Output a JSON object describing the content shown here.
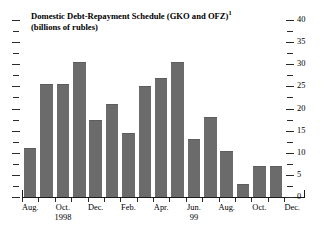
{
  "title": {
    "line1": "Domestic Debt-Repayment Schedule (GKO and OFZ)",
    "footnote_marker": "1",
    "line2": "(billions of rubles)"
  },
  "axes": {
    "y_label": "",
    "y_ticks": [
      "0",
      "5",
      "10",
      "15",
      "20",
      "25",
      "30",
      "35",
      "40"
    ],
    "x_labels": [
      {
        "label": "Aug.",
        "year": ""
      },
      {
        "label": "Oct.",
        "year": "1998"
      },
      {
        "label": "Dec.",
        "year": ""
      },
      {
        "label": "Feb.",
        "year": ""
      },
      {
        "label": "Apr.",
        "year": ""
      },
      {
        "label": "Jun.",
        "year": "99"
      },
      {
        "label": "Aug.",
        "year": ""
      },
      {
        "label": "Oct.",
        "year": ""
      },
      {
        "label": "Dec.",
        "year": ""
      }
    ]
  },
  "style": {
    "bar_color": "#6b6b6b",
    "axis_color": "#1a1a1a",
    "background": "#ffffff"
  },
  "chart_data": {
    "type": "bar",
    "title": "Domestic Debt-Repayment Schedule (GKO and OFZ)",
    "subtitle": "(billions of rubles)",
    "xlabel": "",
    "ylabel": "billions of rubles",
    "ylim": [
      0,
      40
    ],
    "y_ticks": [
      0,
      5,
      10,
      15,
      20,
      25,
      30,
      35,
      40
    ],
    "y_axis_position": "right",
    "grid": false,
    "legend": null,
    "categories": [
      "Aug. 1998",
      "Sep. 1998",
      "Oct. 1998",
      "Nov. 1998",
      "Dec. 1998",
      "Jan. 1999",
      "Feb. 1999",
      "Mar. 1999",
      "Apr. 1999",
      "May 1999",
      "Jun. 1999",
      "Jul. 1999",
      "Aug. 1999",
      "Sep. 1999",
      "Oct. 1999",
      "Nov. 1999"
    ],
    "values": [
      11.0,
      25.5,
      25.5,
      30.5,
      17.5,
      21.0,
      14.5,
      25.0,
      27.0,
      30.5,
      13.0,
      18.0,
      10.5,
      3.0,
      7.0,
      7.0
    ],
    "x_tick_labels": [
      "Aug.",
      "Oct. 1998",
      "Dec.",
      "Feb.",
      "Apr.",
      "Jun. 99",
      "Aug.",
      "Oct.",
      "Dec."
    ]
  }
}
